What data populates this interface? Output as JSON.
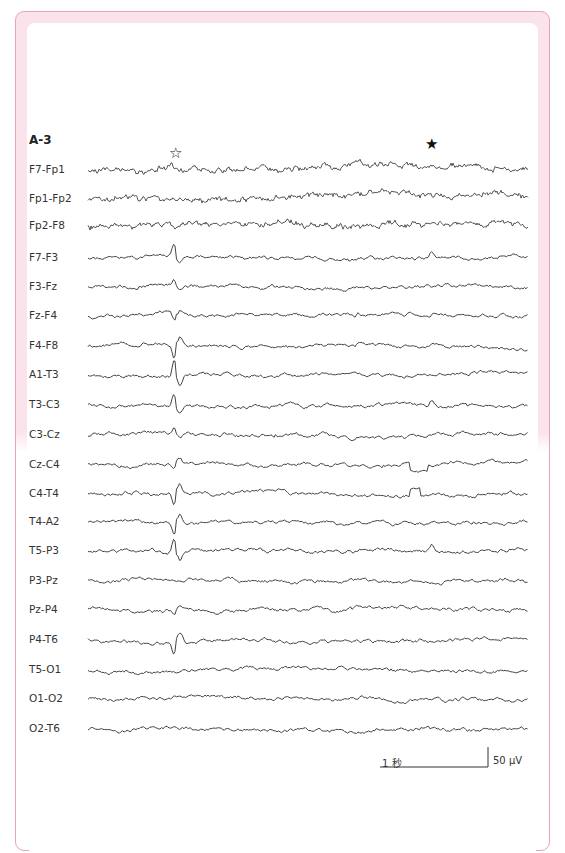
{
  "figure": {
    "panel_label": "A-3",
    "markers": [
      {
        "name": "open-star",
        "glyph": "☆",
        "x": 177,
        "note": "above F7-Fp1 at first spike"
      },
      {
        "name": "filled-star",
        "glyph": "★",
        "x": 433,
        "note": "above F7-Fp1 later"
      }
    ],
    "scale_bar": {
      "time_label": "1 秒",
      "amplitude_label": "50 μV"
    },
    "colors": {
      "frame_border": "#e9a3b6",
      "frame_fill": "#fbe3ec",
      "trace": "#444444",
      "text": "#333333"
    }
  },
  "chart_data": {
    "type": "line",
    "title": "A-3",
    "subtype": "EEG bipolar montage",
    "xlabel": "time",
    "ylabel": "",
    "channels": [
      "F7-Fp1",
      "Fp1-Fp2",
      "Fp2-F8",
      "F7-F3",
      "F3-Fz",
      "Fz-F4",
      "F4-F8",
      "A1-T3",
      "T3-C3",
      "C3-Cz",
      "Cz-C4",
      "C4-T4",
      "T4-A2",
      "T5-P3",
      "P3-Pz",
      "Pz-P4",
      "P4-T6",
      "T5-O1",
      "O1-O2",
      "O2-T6"
    ],
    "baselines_px": [
      170,
      199,
      226,
      258,
      287,
      316,
      346,
      375,
      405,
      435,
      465,
      494,
      522,
      551,
      581,
      610,
      640,
      670,
      699,
      729
    ],
    "spike_positions_px": {
      "open_star_event": 176,
      "filled_star_event": 432
    },
    "scale": {
      "time": "1 秒",
      "amplitude": "50 μV"
    },
    "annotations": [
      "☆ spike discharge",
      "★ later event",
      "step artifact in Cz-C4 / C4-T4 near x≈410"
    ]
  }
}
